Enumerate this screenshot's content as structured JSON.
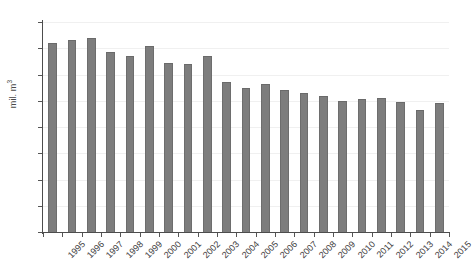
{
  "chart_data": {
    "type": "bar",
    "title": "",
    "subtitle": "",
    "xlabel": "",
    "ylabel": "mil. m3",
    "ylabel_display": "mil. m",
    "ylabel_superscript": "3",
    "ylim": [
      0,
      80
    ],
    "ytick_step": 10,
    "yticks": [
      80,
      70,
      60,
      50,
      40,
      30,
      20,
      10,
      0
    ],
    "grid": true,
    "legend": false,
    "legend_position": "none",
    "bar_color": "#7d7d7d",
    "categories": [
      "1995",
      "1996",
      "1997",
      "1998",
      "1999",
      "2000",
      "2001",
      "2002",
      "2003",
      "2004",
      "2005",
      "2006",
      "2007",
      "2008",
      "2009",
      "2010",
      "2011",
      "2012",
      "2013",
      "2014",
      "2015"
    ],
    "values": [
      72.0,
      73.0,
      74.0,
      68.5,
      67.0,
      71.0,
      64.5,
      64.0,
      67.0,
      57.0,
      55.0,
      56.5,
      54.0,
      53.0,
      52.0,
      50.0,
      50.5,
      51.0,
      49.5,
      46.5,
      49.0
    ],
    "series": [
      {
        "name": "mil. m3",
        "values": [
          72.0,
          73.0,
          74.0,
          68.5,
          67.0,
          71.0,
          64.5,
          64.0,
          67.0,
          57.0,
          55.0,
          56.5,
          54.0,
          53.0,
          52.0,
          50.0,
          50.5,
          51.0,
          49.5,
          46.5,
          49.0
        ]
      }
    ]
  }
}
